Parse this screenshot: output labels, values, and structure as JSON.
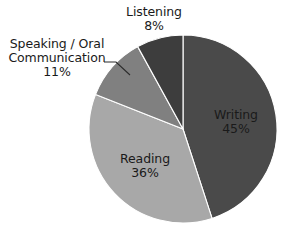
{
  "chart_data": {
    "type": "pie",
    "title": "",
    "categories": [
      "Writing",
      "Reading",
      "Speaking / Oral Communication",
      "Listening"
    ],
    "values": [
      45,
      36,
      11,
      8
    ],
    "value_unit": "%",
    "colors": [
      "#4a4a4a",
      "#a8a8a8",
      "#808080",
      "#3d3d3d"
    ],
    "legend": "none",
    "grid": false,
    "start_angle_deg": 0,
    "direction": "clockwise",
    "slices": [
      {
        "name": "Writing",
        "label": "Writing",
        "value": 45,
        "value_label": "45%",
        "color": "#4a4a4a",
        "label_position": "inside"
      },
      {
        "name": "Reading",
        "label": "Reading",
        "value": 36,
        "value_label": "36%",
        "color": "#a8a8a8",
        "label_position": "inside"
      },
      {
        "name": "Speaking / Oral Communication",
        "label_line1": "Speaking / Oral",
        "label_line2": "Communication",
        "value": 11,
        "value_label": "11%",
        "color": "#808080",
        "label_position": "outside-left",
        "leader_line": true
      },
      {
        "name": "Listening",
        "label": "Listening",
        "value": 8,
        "value_label": "8%",
        "color": "#3d3d3d",
        "label_position": "outside-top"
      }
    ],
    "geometry": {
      "center_x": 183,
      "center_y": 129,
      "radius": 94
    },
    "background_color": "#ffffff",
    "text_color": "#1a1a1a"
  }
}
